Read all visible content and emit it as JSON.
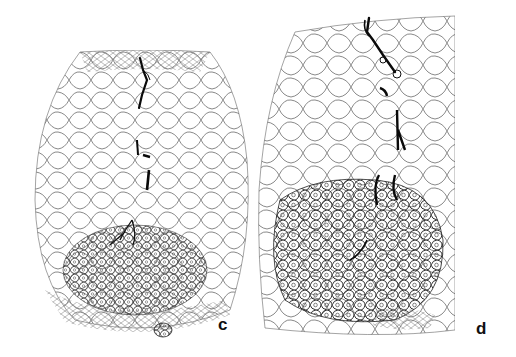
{
  "figure": {
    "panels": [
      {
        "id": "c",
        "label": "c",
        "description": "Line drawing of root cortex cross-section with infection thread descending through cortical cells into a dense cell cluster (primordium) near the base",
        "ink_color": "#222222",
        "thread_color": "#0a0a0a"
      },
      {
        "id": "d",
        "label": "d",
        "description": "Line drawing of root cortex cross-section with branched infection thread penetrating into a large dense cell mass with nucleated cells",
        "ink_color": "#222222",
        "thread_color": "#0a0a0a"
      }
    ],
    "background": "#ffffff"
  }
}
